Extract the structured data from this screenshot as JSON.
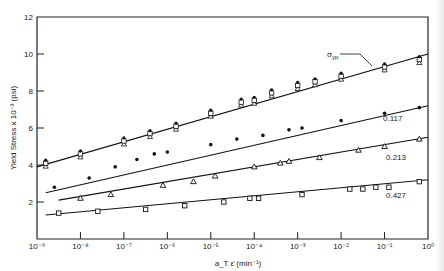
{
  "chart_data": {
    "type": "scatter",
    "title": "",
    "xlabel": "a_T ε̇ (min⁻¹)",
    "ylabel": "Yield Stress x 10⁻³ (psi)",
    "xscale": "log",
    "xlim_exp": [
      -9,
      0
    ],
    "ylim": [
      0,
      12
    ],
    "x_tick_labels": [
      "10⁻⁹",
      "10⁻⁸",
      "10⁻⁷",
      "10⁻⁶",
      "10⁻⁵",
      "10⁻⁴",
      "10⁻³",
      "10⁻²",
      "10⁻¹",
      "10⁰"
    ],
    "y_ticks": [
      2,
      4,
      6,
      8,
      10,
      12
    ],
    "grid": false,
    "legend": "none (curves labeled inline)",
    "series": [
      {
        "name": "σ_yp",
        "label": "σyp",
        "marker": "square-open / dot / triangle (overlapping)",
        "line": {
          "x_exp": [
            -9.0,
            0.0
          ],
          "y": [
            3.9,
            10.0
          ]
        },
        "points": [
          {
            "x_exp": -8.8,
            "y": 4.1
          },
          {
            "x_exp": -8.0,
            "y": 4.6
          },
          {
            "x_exp": -7.0,
            "y": 5.3
          },
          {
            "x_exp": -6.4,
            "y": 5.7
          },
          {
            "x_exp": -5.8,
            "y": 6.1
          },
          {
            "x_exp": -5.0,
            "y": 6.8
          },
          {
            "x_exp": -4.3,
            "y": 7.4
          },
          {
            "x_exp": -4.0,
            "y": 7.5
          },
          {
            "x_exp": -3.6,
            "y": 7.9
          },
          {
            "x_exp": -3.0,
            "y": 8.3
          },
          {
            "x_exp": -2.6,
            "y": 8.5
          },
          {
            "x_exp": -2.0,
            "y": 8.8
          },
          {
            "x_exp": -1.0,
            "y": 9.3
          },
          {
            "x_exp": -0.2,
            "y": 9.7
          }
        ]
      },
      {
        "name": "0.117",
        "label": "0.117",
        "marker": "filled-circle",
        "line": {
          "x_exp": [
            -8.8,
            0.0
          ],
          "y": [
            2.5,
            7.2
          ]
        },
        "points": [
          {
            "x_exp": -8.6,
            "y": 2.8
          },
          {
            "x_exp": -7.8,
            "y": 3.3
          },
          {
            "x_exp": -7.2,
            "y": 3.9
          },
          {
            "x_exp": -6.7,
            "y": 4.3
          },
          {
            "x_exp": -6.3,
            "y": 4.6
          },
          {
            "x_exp": -6.0,
            "y": 4.7
          },
          {
            "x_exp": -5.0,
            "y": 5.1
          },
          {
            "x_exp": -4.4,
            "y": 5.4
          },
          {
            "x_exp": -3.8,
            "y": 5.6
          },
          {
            "x_exp": -3.2,
            "y": 5.9
          },
          {
            "x_exp": -2.9,
            "y": 6.0
          },
          {
            "x_exp": -2.0,
            "y": 6.4
          },
          {
            "x_exp": -1.0,
            "y": 6.8
          },
          {
            "x_exp": -0.2,
            "y": 7.1
          }
        ]
      },
      {
        "name": "0.213",
        "label": "0.213",
        "marker": "open-triangle",
        "line": {
          "x_exp": [
            -8.5,
            0.0
          ],
          "y": [
            2.1,
            5.5
          ]
        },
        "points": [
          {
            "x_exp": -8.0,
            "y": 2.2
          },
          {
            "x_exp": -7.3,
            "y": 2.4
          },
          {
            "x_exp": -6.1,
            "y": 2.9
          },
          {
            "x_exp": -5.4,
            "y": 3.1
          },
          {
            "x_exp": -4.9,
            "y": 3.4
          },
          {
            "x_exp": -4.0,
            "y": 3.9
          },
          {
            "x_exp": -3.4,
            "y": 4.1
          },
          {
            "x_exp": -3.2,
            "y": 4.2
          },
          {
            "x_exp": -2.5,
            "y": 4.4
          },
          {
            "x_exp": -1.6,
            "y": 4.8
          },
          {
            "x_exp": -1.0,
            "y": 5.0
          },
          {
            "x_exp": -0.2,
            "y": 5.4
          }
        ]
      },
      {
        "name": "0.427",
        "label": "0.427",
        "marker": "open-square",
        "line": {
          "x_exp": [
            -8.8,
            0.0
          ],
          "y": [
            1.3,
            3.2
          ]
        },
        "points": [
          {
            "x_exp": -8.5,
            "y": 1.4
          },
          {
            "x_exp": -7.6,
            "y": 1.5
          },
          {
            "x_exp": -6.5,
            "y": 1.6
          },
          {
            "x_exp": -5.6,
            "y": 1.8
          },
          {
            "x_exp": -4.7,
            "y": 2.0
          },
          {
            "x_exp": -4.1,
            "y": 2.2
          },
          {
            "x_exp": -3.9,
            "y": 2.2
          },
          {
            "x_exp": -2.9,
            "y": 2.4
          },
          {
            "x_exp": -1.8,
            "y": 2.7
          },
          {
            "x_exp": -1.5,
            "y": 2.7
          },
          {
            "x_exp": -1.2,
            "y": 2.8
          },
          {
            "x_exp": -0.9,
            "y": 2.8
          },
          {
            "x_exp": -0.2,
            "y": 3.1
          }
        ]
      }
    ]
  }
}
